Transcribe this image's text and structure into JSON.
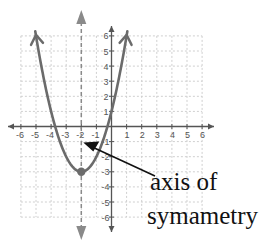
{
  "chart_data": {
    "type": "line",
    "title": "",
    "function": "y = (x + 2)^2 - 3",
    "series": [
      {
        "name": "parabola",
        "x": [
          -5,
          -4,
          -3,
          -2,
          -1,
          0,
          1
        ],
        "y": [
          6,
          1,
          -2,
          -3,
          -2,
          1,
          6
        ]
      }
    ],
    "vertex": {
      "x": -2,
      "y": -3
    },
    "axis_of_symmetry": {
      "x": -2,
      "style": "dashed"
    },
    "x_intercepts": [
      -3.73,
      -0.27
    ],
    "y_intercept": 1,
    "xlim": [
      -6,
      6
    ],
    "ylim": [
      -6,
      6
    ],
    "x_tick_labels": [
      "-6",
      "-5",
      "-4",
      "-3",
      "-2",
      "-1",
      "1",
      "2",
      "3",
      "4",
      "5",
      "6"
    ],
    "y_tick_labels": [
      "6",
      "5",
      "4",
      "3",
      "2",
      "1",
      "-1",
      "-2",
      "-3",
      "-4",
      "-5",
      "-6"
    ],
    "grid": true,
    "xlabel": "",
    "ylabel": "",
    "annotations": [
      {
        "text_line1": "axis of",
        "text_line2": "symametry",
        "points_to": {
          "x": -2,
          "y": -1
        }
      }
    ]
  },
  "annotation": {
    "line1": "axis of",
    "line2": "symametry"
  },
  "colors": {
    "curve": "#6b6b6b",
    "axes": "#555555",
    "grid": "#cfcfcf",
    "symmetry_line": "#8a8a8a",
    "annotation_arrow": "#111111"
  }
}
